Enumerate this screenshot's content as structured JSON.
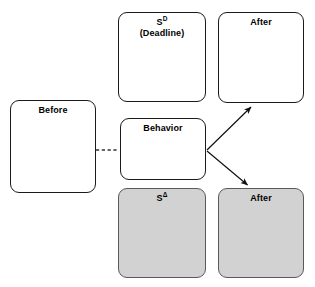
{
  "diagram": {
    "type": "behavior-contingency-diagram",
    "canvas": {
      "width": 315,
      "height": 287
    },
    "colors": {
      "shaded_fill": "#d2d2d2",
      "plain_fill": "#ffffff",
      "stroke": "#1a1a1a",
      "shaded_stroke": "#5a5a5a"
    },
    "nodes": {
      "before": {
        "label": "Before",
        "shaded": false,
        "x": 10,
        "y": 100,
        "w": 86,
        "h": 93
      },
      "deadline": {
        "label_line1": "S",
        "label_sup": "D",
        "label_line2": "(Deadline)",
        "shaded": false,
        "x": 118,
        "y": 12,
        "w": 88,
        "h": 90
      },
      "after_top": {
        "label": "After",
        "shaded": false,
        "x": 218,
        "y": 12,
        "w": 86,
        "h": 91
      },
      "behavior": {
        "label": "Behavior",
        "shaded": false,
        "x": 120,
        "y": 118,
        "w": 86,
        "h": 62
      },
      "s_delta": {
        "label_line1": "S",
        "label_sup": "Δ",
        "shaded": true,
        "x": 118,
        "y": 188,
        "w": 88,
        "h": 90
      },
      "after_bottom": {
        "label": "After",
        "shaded": true,
        "x": 218,
        "y": 188,
        "w": 86,
        "h": 90
      }
    },
    "connectors": [
      {
        "name": "before-to-behavior",
        "style": "dashed",
        "arrowhead": false,
        "from": [
          96,
          150
        ],
        "to": [
          119,
          150
        ]
      },
      {
        "name": "behavior-to-after-top",
        "style": "solid",
        "arrowhead": true,
        "from": [
          207,
          150
        ],
        "to": [
          252,
          106
        ]
      },
      {
        "name": "behavior-to-after-bottom",
        "style": "solid",
        "arrowhead": true,
        "from": [
          207,
          151
        ],
        "to": [
          248,
          186
        ]
      }
    ]
  }
}
